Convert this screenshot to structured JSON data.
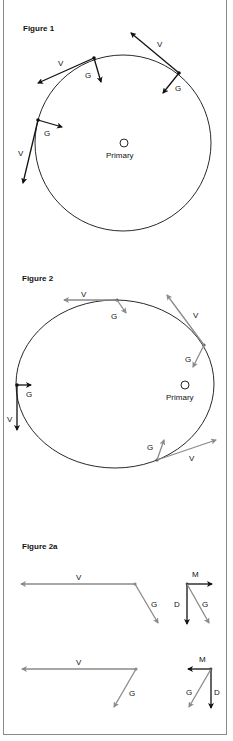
{
  "colors": {
    "black_vector": "#111111",
    "gray_vector": "#8a8a8a",
    "frame": "#8a8a8a",
    "background": "#ffffff"
  },
  "figure1": {
    "title": "Figure 1",
    "primary_label": "Primary",
    "vectors": [
      {
        "point": "upper-left",
        "v_label": "V",
        "g_label": "G"
      },
      {
        "point": "upper-right",
        "v_label": "V",
        "g_label": "G"
      },
      {
        "point": "left",
        "v_label": "V",
        "g_label": "G"
      }
    ]
  },
  "figure2": {
    "title": "Figure 2",
    "primary_label": "Primary",
    "vectors": [
      {
        "point": "top",
        "v_label": "V",
        "g_label": "G"
      },
      {
        "point": "upper-right",
        "v_label": "V",
        "g_label": "G"
      },
      {
        "point": "left",
        "v_label": "V",
        "g_label": "G"
      },
      {
        "point": "lower-right",
        "v_label": "V",
        "g_label": "G"
      }
    ]
  },
  "figure2a": {
    "title": "Figure 2a",
    "row1": {
      "v_label": "V",
      "g_label": "G",
      "m_label": "M",
      "d_label": "D",
      "g2_label": "G"
    },
    "row2": {
      "v_label": "V",
      "g_label": "G",
      "m_label": "M",
      "d_label": "D",
      "g2_label": "G"
    }
  }
}
